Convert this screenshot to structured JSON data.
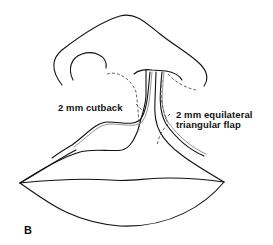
{
  "figure": {
    "panel_label": "B",
    "labels": {
      "cutback": "2 mm cutback",
      "flap_line1": "2 mm equilateral",
      "flap_line2": "triangular flap"
    },
    "colors": {
      "line": "#111111",
      "dashed": "#555555",
      "background": "#ffffff"
    }
  }
}
